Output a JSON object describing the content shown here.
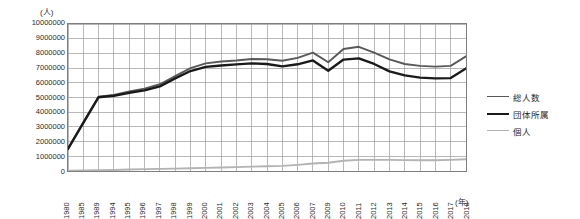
{
  "chart_data": {
    "type": "line",
    "title": "",
    "ylabel": "(人)",
    "xlabel": "(年)",
    "ylim": [
      0,
      10000000
    ],
    "ytick_step": 1000000,
    "grid": true,
    "legend_position": "right",
    "categories": [
      "1980",
      "1985",
      "1989",
      "1994",
      "1995",
      "1996",
      "1997",
      "1998",
      "1999",
      "2000",
      "2001",
      "2002",
      "2003",
      "2004",
      "2005",
      "2006",
      "2007",
      "2009",
      "2010",
      "2011",
      "2012",
      "2013",
      "2014",
      "2015",
      "2016",
      "2017",
      "2018"
    ],
    "yticks": [
      "0",
      "1000000",
      "2000000",
      "3000000",
      "4000000",
      "5000000",
      "6000000",
      "7000000",
      "8000000",
      "9000000",
      "10000000"
    ],
    "series": [
      {
        "name": "総人数",
        "color": "#595959",
        "width": 1.9,
        "values": [
          1520000,
          3300000,
          5060000,
          5180000,
          5420000,
          5600000,
          5900000,
          6450000,
          7000000,
          7320000,
          7450000,
          7520000,
          7620000,
          7600000,
          7500000,
          7700000,
          8050000,
          7400000,
          8300000,
          8450000,
          8050000,
          7600000,
          7280000,
          7150000,
          7100000,
          7150000,
          7800000
        ]
      },
      {
        "name": "団体所属",
        "color": "#1a1a1a",
        "width": 2.4,
        "values": [
          1500000,
          3280000,
          5020000,
          5120000,
          5320000,
          5480000,
          5760000,
          6300000,
          6800000,
          7080000,
          7180000,
          7250000,
          7320000,
          7280000,
          7120000,
          7260000,
          7520000,
          6820000,
          7580000,
          7660000,
          7280000,
          6780000,
          6500000,
          6350000,
          6300000,
          6320000,
          6980000
        ]
      },
      {
        "name": "個人",
        "color": "#b3b3b3",
        "width": 1.9,
        "values": [
          20000,
          30000,
          55000,
          70000,
          100000,
          125000,
          145000,
          160000,
          185000,
          210000,
          240000,
          265000,
          295000,
          320000,
          350000,
          420000,
          510000,
          560000,
          700000,
          760000,
          760000,
          760000,
          740000,
          730000,
          730000,
          760000,
          800000
        ]
      }
    ]
  },
  "legend": {
    "items": [
      {
        "label": "総人数"
      },
      {
        "label": "団体所属"
      },
      {
        "label": "個人"
      }
    ]
  }
}
